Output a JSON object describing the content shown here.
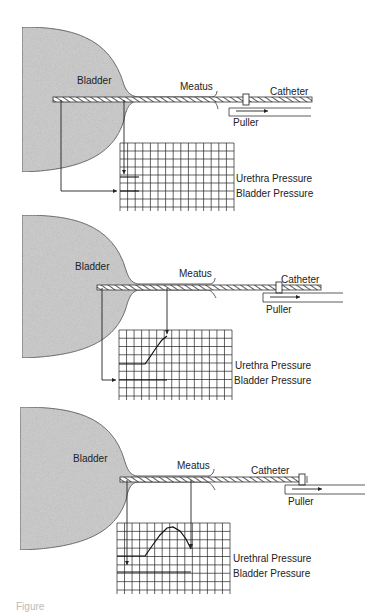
{
  "figure": {
    "caption_fragment": "Figure",
    "colors": {
      "ink": "#222222",
      "bladder_fill": "#c9c9c9",
      "background": "#ffffff"
    },
    "panels": [
      {
        "id": "stage-1",
        "offset_y": 0,
        "labels": {
          "bladder": "Bladder",
          "meatus": "Meatus",
          "catheter": "Catheter",
          "puller": "Puller",
          "urethra_pressure": "Urethra Pressure",
          "bladder_pressure": "Bladder Pressure"
        },
        "catheter": {
          "x1": 53,
          "x2": 312,
          "y": 99
        },
        "clamp_x": 246,
        "puller": {
          "x1": 229,
          "x2": 311,
          "y_top": 108,
          "y_bot": 116,
          "arrow_x1": 236,
          "arrow_x2": 268
        },
        "bladder_sensor_x": 61,
        "urethra_sensor_x": 124,
        "grid": {
          "x": 120,
          "y": 143,
          "w": 114,
          "h": 64,
          "cols": 15,
          "rows": 8
        },
        "urethra_trace": [
          [
            120,
            177
          ],
          [
            139,
            177
          ]
        ],
        "bladder_trace": [
          [
            120,
            191
          ],
          [
            139,
            191
          ]
        ],
        "urethra_arrow_end_y": 174,
        "bladder_arrow_y": 191
      },
      {
        "id": "stage-2",
        "offset_y": 0,
        "labels": {
          "bladder": "Bladder",
          "meatus": "Meatus",
          "catheter": "Catheter",
          "puller": "Puller",
          "urethra_pressure": "Urethra Pressure",
          "bladder_pressure": "Bladder Pressure"
        },
        "catheter": {
          "x1": 97,
          "x2": 321,
          "y": 287
        },
        "clamp_x": 279,
        "puller": {
          "x1": 263,
          "x2": 343,
          "y_top": 293,
          "y_bot": 302,
          "arrow_x1": 270,
          "arrow_x2": 300
        },
        "bladder_sensor_x": 102,
        "urethra_sensor_x": 167,
        "grid": {
          "x": 119,
          "y": 330,
          "w": 113,
          "h": 66,
          "cols": 15,
          "rows": 8
        },
        "urethra_trace": [
          [
            119,
            364
          ],
          [
            145,
            364
          ],
          [
            150,
            357
          ],
          [
            156,
            348
          ],
          [
            162,
            340
          ],
          [
            167,
            336
          ]
        ],
        "bladder_trace": [
          [
            119,
            380
          ],
          [
            167,
            380
          ]
        ],
        "urethra_arrow_end_y": 336,
        "bladder_arrow_y": 380
      },
      {
        "id": "stage-3",
        "offset_y": 0,
        "labels": {
          "bladder": "Bladder",
          "meatus": "Meatus",
          "catheter": "Catheter",
          "puller": "Puller",
          "urethra_pressure": "Urethral Pressure",
          "bladder_pressure": "Bladder Pressure"
        },
        "catheter": {
          "x1": 120,
          "x2": 305,
          "y": 479
        },
        "clamp_x": 302,
        "puller": {
          "x1": 285,
          "x2": 365,
          "y_top": 485,
          "y_bot": 494,
          "arrow_x1": 292,
          "arrow_x2": 322
        },
        "bladder_sensor_x": 127,
        "urethra_sensor_x": 191,
        "grid": {
          "x": 117,
          "y": 523,
          "w": 113,
          "h": 67,
          "cols": 15,
          "rows": 8
        },
        "urethra_trace": [
          [
            117,
            556
          ],
          [
            145,
            556
          ],
          [
            152,
            546
          ],
          [
            160,
            535
          ],
          [
            167,
            528
          ],
          [
            173,
            527
          ],
          [
            180,
            531
          ],
          [
            186,
            539
          ],
          [
            191,
            549
          ]
        ],
        "bladder_trace": [
          [
            117,
            572
          ],
          [
            191,
            572
          ]
        ],
        "urethra_arrow_end_y": 549,
        "bladder_arrow_y": 566
      }
    ]
  }
}
